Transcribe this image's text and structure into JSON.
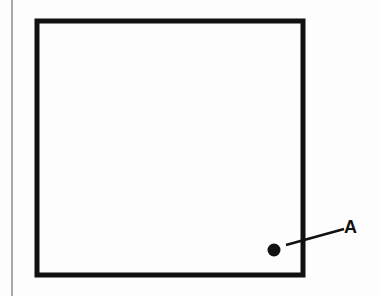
{
  "diagram": {
    "shape": "square",
    "point": {
      "label": "A"
    },
    "colors": {
      "stroke": "#111111",
      "background": "#fdfdfd",
      "margin": "#a8a8a8"
    }
  }
}
